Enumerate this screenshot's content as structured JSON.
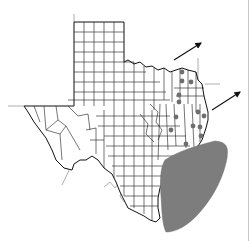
{
  "map": {
    "subject": "Texas county map",
    "colors": {
      "background": "#ffffff",
      "county_line": "#1a1a1a",
      "state_border": "#111111",
      "neighbor_border": "#9a9a9a",
      "gulf_shading": "#7d7d7d",
      "marker": "#6e6e6e",
      "arrow": "#111111"
    },
    "markers": [
      {
        "x": 182,
        "y": 72
      },
      {
        "x": 182,
        "y": 81
      },
      {
        "x": 191,
        "y": 82
      },
      {
        "x": 179,
        "y": 95
      },
      {
        "x": 179,
        "y": 102
      },
      {
        "x": 198,
        "y": 112
      },
      {
        "x": 204,
        "y": 116
      },
      {
        "x": 176,
        "y": 117
      },
      {
        "x": 193,
        "y": 126
      },
      {
        "x": 200,
        "y": 127
      },
      {
        "x": 171,
        "y": 130
      },
      {
        "x": 201,
        "y": 136
      },
      {
        "x": 186,
        "y": 144
      }
    ],
    "arrows": [
      {
        "from": [
          174,
          60
        ],
        "to": [
          201,
          43
        ]
      },
      {
        "from": [
          212,
          110
        ],
        "to": [
          240,
          92
        ]
      }
    ],
    "shaded_area": {
      "label": "gulf-shaded-region",
      "path": "M165,160 C180,150 200,145 215,141 C225,142 229,145 227,158 C224,175 215,195 200,212 C188,226 176,232 166,232 C162,224 162,210 161,196 C160,182 160,168 165,160 Z"
    }
  }
}
